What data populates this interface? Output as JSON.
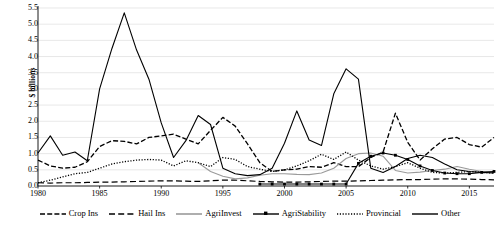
{
  "chart_data": {
    "type": "line",
    "title": "",
    "xlabel": "",
    "ylabel": "$ billions",
    "xlim": [
      1980,
      2017
    ],
    "ylim": [
      0.0,
      5.5
    ],
    "grid": true,
    "grid_axis": "y",
    "legend_position": "bottom",
    "y_ticks": [
      "0.0",
      "0.5",
      "1.0",
      "1.5",
      "2.0",
      "2.5",
      "3.0",
      "3.5",
      "4.0",
      "4.5",
      "5.0",
      "5.5"
    ],
    "y_tick_values": [
      0.0,
      0.5,
      1.0,
      1.5,
      2.0,
      2.5,
      3.0,
      3.5,
      4.0,
      4.5,
      5.0,
      5.5
    ],
    "x_ticks": [
      "1980",
      "1985",
      "1990",
      "1995",
      "2000",
      "2005",
      "2010",
      "2015"
    ],
    "x_tick_values": [
      1980,
      1985,
      1990,
      1995,
      2000,
      2005,
      2010,
      2015
    ],
    "x": [
      1980,
      1981,
      1982,
      1983,
      1984,
      1985,
      1986,
      1987,
      1988,
      1989,
      1990,
      1991,
      1992,
      1993,
      1994,
      1995,
      1996,
      1997,
      1998,
      1999,
      2000,
      2001,
      2002,
      2003,
      2004,
      2005,
      2006,
      2007,
      2008,
      2009,
      2010,
      2011,
      2012,
      2013,
      2014,
      2015,
      2016,
      2017
    ],
    "series": [
      {
        "name": "Crop Ins",
        "color": "#000000",
        "style": "dashed",
        "values": [
          0.8,
          0.62,
          0.55,
          0.58,
          0.75,
          1.22,
          1.4,
          1.38,
          1.3,
          1.5,
          1.55,
          1.6,
          1.45,
          1.3,
          1.72,
          2.12,
          1.85,
          1.3,
          0.72,
          0.45,
          0.5,
          0.52,
          0.6,
          0.58,
          0.72,
          0.6,
          0.6,
          0.88,
          1.05,
          2.25,
          1.35,
          0.8,
          1.15,
          1.45,
          1.5,
          1.28,
          1.2,
          1.5
        ]
      },
      {
        "name": "Hail Ins",
        "color": "#000000",
        "style": "long-dash",
        "values": [
          0.1,
          0.09,
          0.1,
          0.1,
          0.11,
          0.12,
          0.12,
          0.13,
          0.14,
          0.15,
          0.16,
          0.16,
          0.15,
          0.14,
          0.16,
          0.18,
          0.18,
          0.16,
          0.14,
          0.13,
          0.12,
          0.12,
          0.13,
          0.14,
          0.15,
          0.15,
          0.16,
          0.17,
          0.18,
          0.19,
          0.2,
          0.2,
          0.21,
          0.22,
          0.22,
          0.21,
          0.2,
          0.19
        ]
      },
      {
        "name": "AgriInvest",
        "color": "#9a9a9a",
        "style": "solid",
        "values": [
          null,
          null,
          null,
          null,
          null,
          null,
          null,
          null,
          null,
          null,
          null,
          null,
          null,
          0.72,
          0.45,
          0.3,
          0.22,
          0.25,
          0.33,
          0.38,
          0.38,
          0.36,
          0.35,
          0.4,
          0.55,
          0.85,
          1.0,
          1.02,
          0.92,
          0.48,
          0.4,
          0.43,
          0.48,
          0.52,
          0.6,
          0.52,
          0.45,
          0.42
        ]
      },
      {
        "name": "AgriStability",
        "color": "#000000",
        "style": "solid-marker",
        "values": [
          null,
          null,
          null,
          null,
          null,
          null,
          null,
          null,
          null,
          null,
          null,
          null,
          null,
          null,
          null,
          null,
          null,
          null,
          0.06,
          0.06,
          0.06,
          0.06,
          0.06,
          0.06,
          0.06,
          0.06,
          0.7,
          0.92,
          1.02,
          0.95,
          0.82,
          0.62,
          0.48,
          0.4,
          0.38,
          0.38,
          0.42,
          0.45
        ]
      },
      {
        "name": "Provincial",
        "color": "#000000",
        "style": "dotted",
        "values": [
          0.1,
          0.18,
          0.28,
          0.38,
          0.42,
          0.55,
          0.68,
          0.75,
          0.8,
          0.82,
          0.8,
          0.62,
          0.78,
          0.72,
          0.6,
          0.88,
          0.82,
          0.6,
          0.52,
          0.45,
          0.5,
          0.62,
          0.78,
          0.98,
          0.82,
          1.05,
          0.8,
          0.62,
          0.52,
          0.6,
          0.72,
          0.55,
          0.42,
          0.4,
          0.42,
          0.45,
          0.42,
          0.4
        ]
      },
      {
        "name": "Other",
        "color": "#000000",
        "style": "solid",
        "values": [
          1.02,
          1.55,
          0.95,
          1.05,
          0.78,
          3.0,
          4.25,
          5.35,
          4.2,
          3.3,
          1.95,
          0.88,
          1.4,
          2.18,
          1.9,
          0.55,
          0.38,
          0.32,
          0.35,
          0.55,
          1.32,
          2.32,
          1.42,
          1.25,
          2.85,
          3.62,
          3.3,
          0.55,
          0.42,
          0.6,
          0.85,
          0.95,
          0.88,
          0.68,
          0.5,
          0.45,
          0.42,
          0.4
        ]
      }
    ]
  },
  "legend": {
    "items": [
      {
        "label": "Crop Ins",
        "style": "dashed"
      },
      {
        "label": "Hail Ins",
        "style": "long-dash"
      },
      {
        "label": "AgriInvest",
        "style": "solid-gray"
      },
      {
        "label": "AgriStability",
        "style": "solid-marker"
      },
      {
        "label": "Provincial",
        "style": "dotted"
      },
      {
        "label": "Other",
        "style": "solid"
      }
    ]
  },
  "colors": {
    "axis": "#000000",
    "grid": "#d9d9d9",
    "line_default": "#000000",
    "line_gray": "#9a9a9a",
    "background": "#ffffff"
  }
}
